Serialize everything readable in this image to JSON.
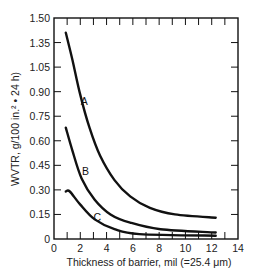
{
  "chart_data": {
    "type": "line",
    "title": "",
    "xlabel": "Thickness of barrier, mil (=25.4 μm)",
    "ylabel": "WVTR, g/100 in.² • 24 h)",
    "xlim": [
      0,
      14
    ],
    "ylim": [
      0,
      1.5
    ],
    "x_ticks": [
      "0",
      "2",
      "4",
      "6",
      "8",
      "10",
      "12",
      "14"
    ],
    "y_ticks": [
      "0",
      "0.15",
      "0.30",
      "0.45",
      "0.60",
      "0.75",
      "0.90",
      "1.05",
      "1.35",
      "1.50"
    ],
    "grid": false,
    "legend": "none (curves labeled inline)",
    "series": [
      {
        "name": "A",
        "x": [
          0.9,
          1.4,
          2.0,
          2.7,
          3.5,
          4.6,
          5.8,
          7.3,
          9.2,
          12.3
        ],
        "y": [
          1.41,
          1.14,
          0.88,
          0.68,
          0.51,
          0.36,
          0.26,
          0.19,
          0.15,
          0.13
        ]
      },
      {
        "name": "B",
        "x": [
          0.9,
          1.4,
          2.1,
          3.1,
          4.3,
          5.8,
          8.1,
          12.3
        ],
        "y": [
          0.68,
          0.54,
          0.37,
          0.24,
          0.15,
          0.1,
          0.06,
          0.04
        ]
      },
      {
        "name": "C",
        "x": [
          0.9,
          1.2,
          2.0,
          3.1,
          4.6,
          6.5,
          12.3
        ],
        "y": [
          0.29,
          0.29,
          0.21,
          0.12,
          0.06,
          0.03,
          0.02
        ]
      }
    ],
    "annotations": [
      {
        "text": "A",
        "x": 2.3,
        "y": 0.82
      },
      {
        "text": "B",
        "x": 2.4,
        "y": 0.39
      },
      {
        "text": "C",
        "x": 3.3,
        "y": 0.11
      }
    ],
    "colors": {
      "line": "#111111",
      "axis": "#111111"
    }
  }
}
